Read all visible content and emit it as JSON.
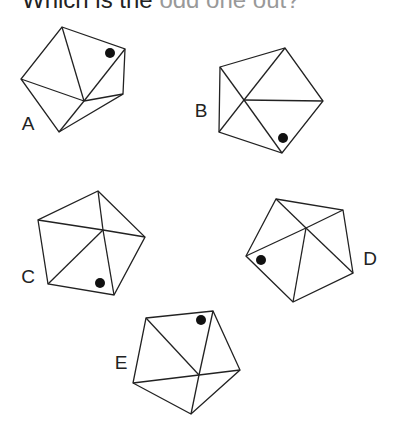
{
  "title": {
    "main": "Which is the",
    "rest": "odd one out?"
  },
  "figures": [
    {
      "label": "A",
      "label_pos": [
        28,
        130
      ],
      "vertices": [
        [
          62,
          27
        ],
        [
          125,
          49
        ],
        [
          123,
          94
        ],
        [
          59,
          132
        ],
        [
          21,
          79
        ]
      ],
      "center": [
        84,
        101
      ],
      "dot": [
        110,
        53
      ]
    },
    {
      "label": "B",
      "label_pos": [
        201,
        117
      ],
      "vertices": [
        [
          220,
          67
        ],
        [
          285,
          48
        ],
        [
          323,
          101
        ],
        [
          282,
          153
        ],
        [
          219,
          132
        ]
      ],
      "center": [
        244,
        100
      ],
      "dot": [
        283,
        138
      ]
    },
    {
      "label": "C",
      "label_pos": [
        28,
        283
      ],
      "vertices": [
        [
          98,
          191
        ],
        [
          145,
          237
        ],
        [
          114,
          295
        ],
        [
          48,
          284
        ],
        [
          38,
          220
        ]
      ],
      "center": [
        103,
        230
      ],
      "dot": [
        100,
        283
      ]
    },
    {
      "label": "D",
      "label_pos": [
        370,
        265
      ],
      "vertices": [
        [
          276,
          199
        ],
        [
          343,
          210
        ],
        [
          353,
          273
        ],
        [
          293,
          302
        ],
        [
          246,
          256
        ]
      ],
      "center": [
        306,
        228
      ],
      "dot": [
        261,
        260
      ]
    },
    {
      "label": "E",
      "label_pos": [
        121,
        369
      ],
      "vertices": [
        [
          146,
          318
        ],
        [
          213,
          311
        ],
        [
          240,
          370
        ],
        [
          191,
          414
        ],
        [
          133,
          383
        ]
      ],
      "center": [
        199,
        375
      ],
      "dot": [
        201,
        320
      ]
    }
  ],
  "colors": {
    "stroke": "#222222",
    "dot": "#111111"
  }
}
